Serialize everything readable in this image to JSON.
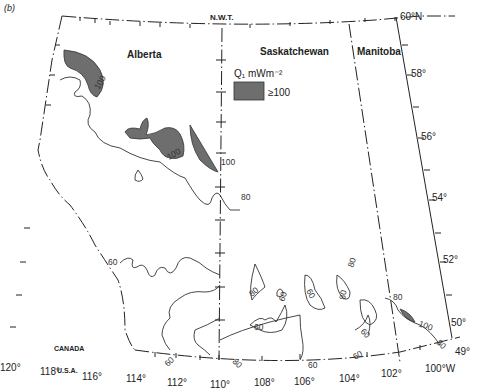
{
  "figure": {
    "corner_text": "(b)"
  },
  "regions": {
    "north": "N.W.T.",
    "alberta": "Alberta",
    "saskatchewan": "Saskatchewan",
    "manitoba": "Manitoba",
    "canada": "CANADA",
    "usa": "U.S.A."
  },
  "legend": {
    "title": "Q₁ mWm⁻²",
    "swatch_color": "#6e6e6e",
    "swatch_label": "≥100"
  },
  "latitude_labels": [
    "60°N",
    "58°",
    "56°",
    "54°",
    "52°",
    "50°",
    "49°"
  ],
  "longitude_labels": [
    "120°",
    "118°",
    "116°",
    "114°",
    "112°",
    "110°",
    "108°",
    "106°",
    "104°",
    "102°",
    "100°W"
  ],
  "contour_labels": {
    "c100_nw": "100",
    "c100_center": "100",
    "c100_border": "100",
    "c80_border": "80",
    "c60_alberta": "60",
    "c80_sask_a": "80",
    "c60_sask_a": "60",
    "c60_sask_b": "60",
    "c60_sask_c": "60",
    "c80_sask_b": "80",
    "c80_sask_c": "80",
    "c60_sask_d": "60",
    "c60_south": "60",
    "c60_south_b": "60",
    "c80_south": "80",
    "c80_manitoba": "80",
    "c100_manitoba": "100",
    "c80_manitoba_s": "80",
    "c60_southeast": "60"
  },
  "colors": {
    "shade": "#6e6e6e",
    "line": "#222222"
  }
}
